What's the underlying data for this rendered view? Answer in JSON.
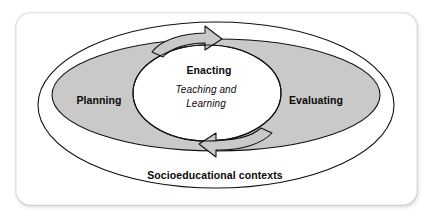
{
  "diagram": {
    "type": "nested-venn-cycle",
    "outer_ellipse": {
      "name": "socioeducational-contexts",
      "label": "Socioeducational contexts",
      "fill": "#ffffff",
      "stroke": "#000000"
    },
    "middle_ellipse": {
      "name": "planning-evaluating-band",
      "fill": "#c9c9c9",
      "stroke": "#000000",
      "labels": [
        {
          "id": "planning",
          "text": "Planning"
        },
        {
          "id": "evaluating",
          "text": "Evaluating"
        }
      ]
    },
    "inner_shape": {
      "name": "enacting-core",
      "fill": "#ffffff",
      "stroke": "#000000",
      "heading": "Enacting",
      "subtext_line1": "Teaching and",
      "subtext_line2": "Learning"
    },
    "cycle_arrows": [
      {
        "id": "top-arrow",
        "direction": "clockwise",
        "position": "top-center"
      },
      {
        "id": "bottom-arrow",
        "direction": "clockwise",
        "position": "bottom-center"
      }
    ],
    "colors": {
      "background": "#ffffff",
      "card": "#ffffff",
      "gray_fill": "#c9c9c9",
      "stroke": "#000000",
      "text": "#0a0a0a"
    }
  }
}
